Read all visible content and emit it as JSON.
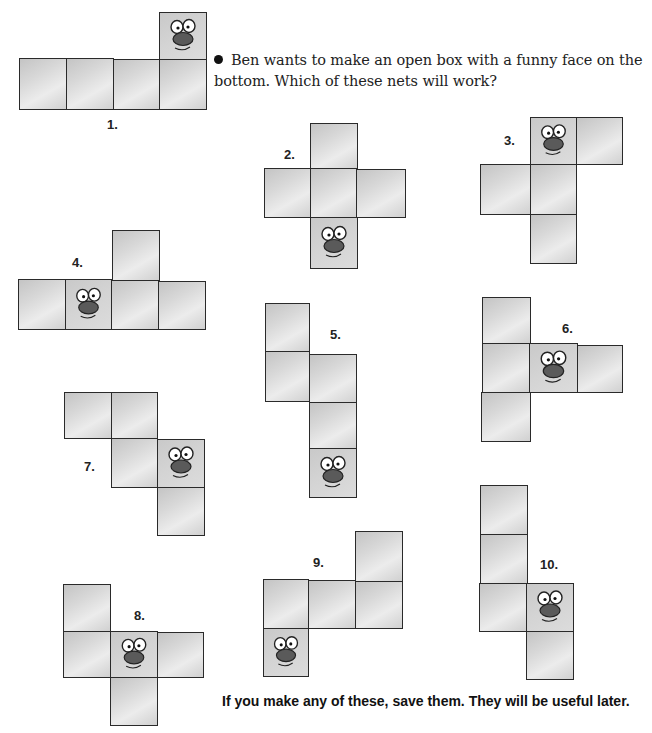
{
  "question": {
    "text": "Ben wants to make an open box with a funny face on the bottom. Which of these nets will work?"
  },
  "footer": {
    "text": "If you make any of these, save them.  They will be useful later."
  },
  "colors": {
    "square_fill": "#d4d4d4",
    "square_border": "#2a2a2a",
    "face_nose": "#555555",
    "text": "#222222"
  },
  "nets": [
    {
      "label": "1.",
      "face_square": 4,
      "squares": 5
    },
    {
      "label": "2.",
      "face_square": 5,
      "squares": 5
    },
    {
      "label": "3.",
      "face_square": 1,
      "squares": 5
    },
    {
      "label": "4.",
      "face_square": 3,
      "squares": 5
    },
    {
      "label": "5.",
      "face_square": 5,
      "squares": 5
    },
    {
      "label": "6.",
      "face_square": 3,
      "squares": 5
    },
    {
      "label": "7.",
      "face_square": 4,
      "squares": 5
    },
    {
      "label": "8.",
      "face_square": 3,
      "squares": 5
    },
    {
      "label": "9.",
      "face_square": 5,
      "squares": 5
    },
    {
      "label": "10.",
      "face_square": 4,
      "squares": 5
    }
  ]
}
